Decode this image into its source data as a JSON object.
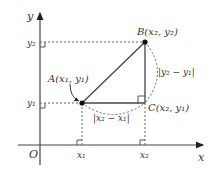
{
  "axes": {
    "x_label": "x",
    "y_label": "y",
    "origin_label": "O"
  },
  "ticks": {
    "x1": "x₁",
    "x2": "x₂",
    "y1": "y₁",
    "y2": "y₂"
  },
  "points": {
    "A": {
      "label": "A(x₁, y₁)"
    },
    "B": {
      "label": "B(x₂, y₂)"
    },
    "C": {
      "label": "C(x₂, y₁)"
    }
  },
  "distances": {
    "horizontal": "|x₂ − x₁|",
    "vertical": "|y₂ − y₁|"
  },
  "colors": {
    "line": "#444444",
    "dotted": "#666666",
    "point": "#111111"
  }
}
